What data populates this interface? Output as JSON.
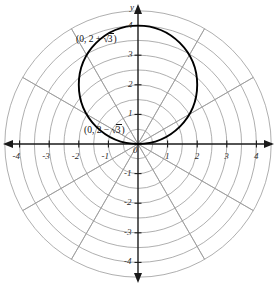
{
  "figure": {
    "kind": "polar-grid-graph",
    "background": "#ffffff",
    "curve_color": "#000000",
    "grid_color": "#9a9a9a",
    "axis_color": "#1a1a1a"
  },
  "axes": {
    "x_label": "",
    "y_label": "y",
    "origin_label": "0",
    "x_ticks": [
      "-4",
      "-3",
      "-2",
      "-1",
      "1",
      "2",
      "3",
      "4"
    ],
    "y_ticks": [
      "4",
      "3",
      "2",
      "1",
      "-1",
      "-2",
      "-3",
      "-4"
    ],
    "x_range": [
      -4.7,
      4.7
    ],
    "y_range": [
      -4.7,
      4.7
    ]
  },
  "polar_grid": {
    "radii": [
      0.5,
      1,
      1.5,
      2,
      2.5,
      3,
      3.5,
      4,
      4.5
    ],
    "spoke_angles_deg": [
      0,
      30,
      60,
      90,
      120,
      150,
      180,
      210,
      240,
      270,
      300,
      330
    ],
    "visible": true
  },
  "annotations": [
    {
      "name": "upper-point-label",
      "text_prefix": "(0, 2 + ",
      "radicand": "3",
      "text_suffix": ")",
      "x": 76,
      "y": 35
    },
    {
      "name": "lower-point-label",
      "text_prefix": "(0, 2 − ",
      "radicand": "3",
      "text_suffix": ")",
      "x": 84,
      "y": 126
    }
  ],
  "chart_data": {
    "type": "line",
    "title": "",
    "xlabel": "",
    "ylabel": "y",
    "xlim": [
      -4.7,
      4.7
    ],
    "ylim": [
      -4.7,
      4.7
    ],
    "grid": "polar",
    "legend": "none",
    "series": [
      {
        "name": "circle r = 4 sin(theta)",
        "equation_polar": "r = 4 sin(θ)",
        "equation_cartesian": "x^2 + (y - 2)^2 = 4",
        "center": [
          0,
          2
        ],
        "radius": 2,
        "passes_through": [
          [
            0,
            0
          ],
          [
            0,
            4
          ],
          [
            2,
            2
          ],
          [
            -2,
            2
          ]
        ]
      }
    ],
    "annotated_points": [
      {
        "label": "(0, 2 + √3)",
        "x": 0,
        "y": 3.732
      },
      {
        "label": "(0, 2 − √3)",
        "x": 0,
        "y": 0.268
      }
    ],
    "xticks": [
      -4,
      -3,
      -2,
      -1,
      0,
      1,
      2,
      3,
      4
    ],
    "yticks": [
      -4,
      -3,
      -2,
      -1,
      0,
      1,
      2,
      3,
      4
    ]
  }
}
